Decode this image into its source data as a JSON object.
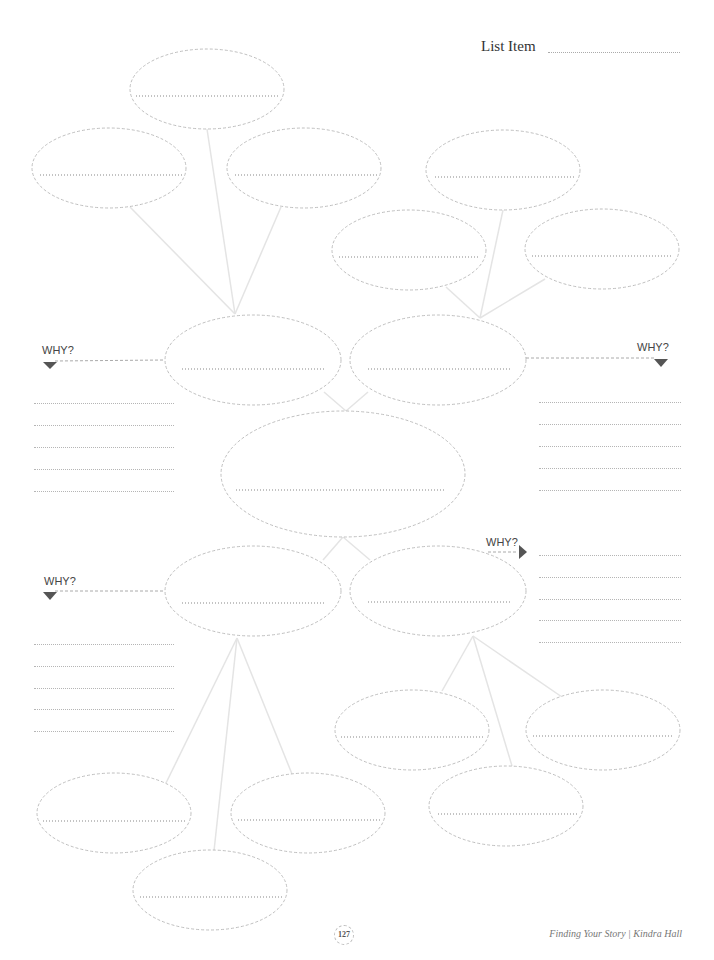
{
  "header": {
    "ghost_text": ""
  },
  "list_item": {
    "label": "List Item"
  },
  "why_labels": {
    "upper_left": "WHY?",
    "upper_right": "WHY?",
    "lower_left": "WHY?",
    "lower_right": "WHY?"
  },
  "footer": {
    "page_number": "127",
    "running_title": "Finding Your Story | Kindra Hall"
  },
  "colors": {
    "ellipse_stroke": "#b8b8b8",
    "connector": "#e6e6e6",
    "dotted_line": "#b5b5b5",
    "arrow": "#555555",
    "text": "#444444"
  },
  "nodes": [
    {
      "id": "top-1",
      "cx": 207,
      "cy": 89,
      "rx": 77,
      "ry": 40
    },
    {
      "id": "top-left",
      "cx": 109,
      "cy": 168,
      "rx": 77,
      "ry": 40
    },
    {
      "id": "top-mid",
      "cx": 304,
      "cy": 168,
      "rx": 77,
      "ry": 40
    },
    {
      "id": "top-right",
      "cx": 503,
      "cy": 170,
      "rx": 77,
      "ry": 40
    },
    {
      "id": "upper-right-left",
      "cx": 409,
      "cy": 250,
      "rx": 77,
      "ry": 40
    },
    {
      "id": "upper-right-right",
      "cx": 602,
      "cy": 249,
      "rx": 77,
      "ry": 40
    },
    {
      "id": "branch-ul",
      "cx": 253,
      "cy": 360,
      "rx": 88,
      "ry": 45
    },
    {
      "id": "branch-ur",
      "cx": 438,
      "cy": 360,
      "rx": 88,
      "ry": 45
    },
    {
      "id": "center",
      "cx": 343,
      "cy": 473,
      "rx": 122,
      "ry": 63
    },
    {
      "id": "branch-ll",
      "cx": 253,
      "cy": 591,
      "rx": 88,
      "ry": 45
    },
    {
      "id": "branch-lr",
      "cx": 438,
      "cy": 591,
      "rx": 88,
      "ry": 45
    },
    {
      "id": "bottom-right-1",
      "cx": 412,
      "cy": 730,
      "rx": 77,
      "ry": 40
    },
    {
      "id": "bottom-right-2",
      "cx": 603,
      "cy": 730,
      "rx": 77,
      "ry": 40
    },
    {
      "id": "bottom-right-3",
      "cx": 506,
      "cy": 806,
      "rx": 77,
      "ry": 40
    },
    {
      "id": "bottom-left-1",
      "cx": 114,
      "cy": 813,
      "rx": 77,
      "ry": 40
    },
    {
      "id": "bottom-left-2",
      "cx": 308,
      "cy": 813,
      "rx": 77,
      "ry": 40
    },
    {
      "id": "bottom-left-3",
      "cx": 210,
      "cy": 890,
      "rx": 77,
      "ry": 40
    }
  ]
}
